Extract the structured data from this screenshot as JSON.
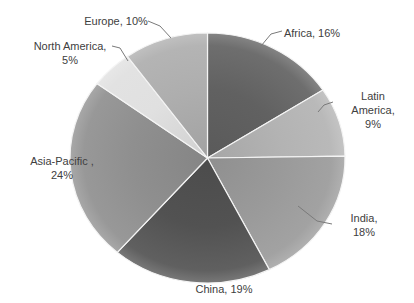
{
  "figure": {
    "background": "#ffffff",
    "text_color": "#404040",
    "leader_line_color": "#7a7a7a",
    "slice_border_color": "#f4f4f4"
  },
  "chart_data": {
    "type": "pie",
    "title": "",
    "legend": "none",
    "label_style": "category name with percentage, outside with leader lines",
    "start_angle_deg": 0,
    "direction": "clockwise",
    "center": {
      "x": 207.5,
      "y": 158,
      "rx": 137.5,
      "ry": 125
    },
    "slices": [
      {
        "name": "Africa",
        "value": 16,
        "color": "#616161",
        "label": "Africa, 16%",
        "label_x": 312,
        "label_y": 33,
        "leader": [
          [
            282,
            31
          ],
          [
            271,
            34
          ],
          [
            261,
            46
          ]
        ]
      },
      {
        "name": "Latin America",
        "value": 9,
        "color": "#b3b3b3",
        "label": "Latin America,\n9%",
        "label_x": 373,
        "label_y": 110,
        "leader": [
          [
            333,
            102
          ],
          [
            324,
            105
          ],
          [
            318,
            112
          ]
        ]
      },
      {
        "name": "India",
        "value": 18,
        "color": "#9a9a9a",
        "label": "India, 18%",
        "label_x": 364,
        "label_y": 225,
        "leader": [
          [
            332,
            224
          ],
          [
            317,
            221
          ],
          [
            298,
            206
          ]
        ]
      },
      {
        "name": "China",
        "value": 19,
        "color": "#525252",
        "label": "China, 19%",
        "label_x": 224,
        "label_y": 289,
        "leader": []
      },
      {
        "name": "Asia-Pacific",
        "value": 24,
        "color": "#8f8f8f",
        "label": "Asia-Pacific ,\n24%",
        "label_x": 62,
        "label_y": 168,
        "leader": []
      },
      {
        "name": "North America",
        "value": 5,
        "color": "#e0e0e0",
        "label": "North America,\n5%",
        "label_x": 70,
        "label_y": 53,
        "leader": [
          [
            112,
            46
          ],
          [
            120,
            48
          ],
          [
            128,
            61
          ]
        ]
      },
      {
        "name": "Europe",
        "value": 10,
        "color": "#aeaeae",
        "label": "Europe, 10%",
        "label_x": 116,
        "label_y": 21,
        "leader": [
          [
            148,
            21
          ],
          [
            160,
            26
          ],
          [
            171,
            38
          ]
        ]
      }
    ]
  }
}
